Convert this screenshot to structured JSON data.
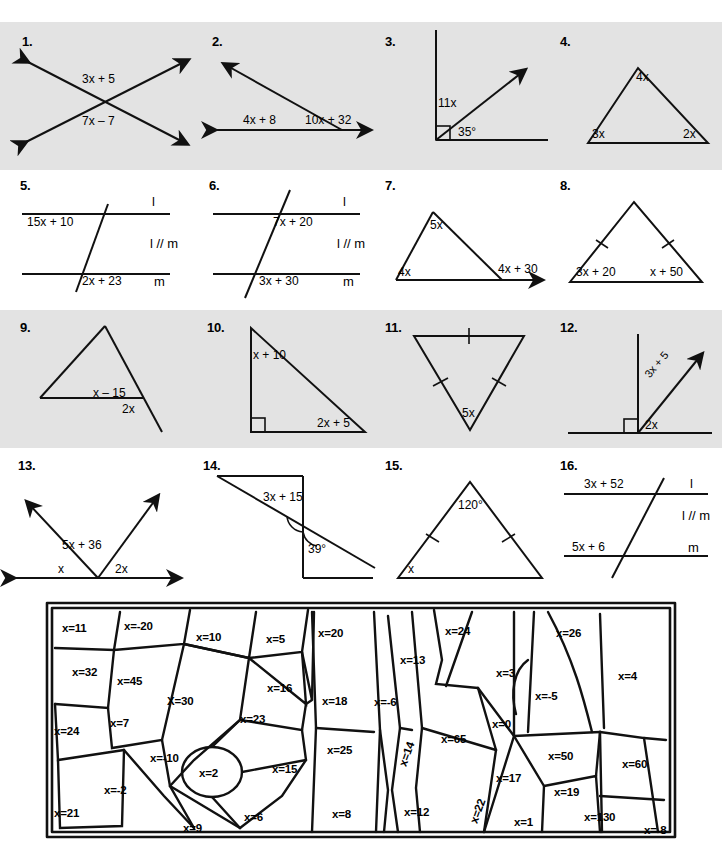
{
  "worksheet": {
    "rows": [
      {
        "shaded": true,
        "problems": [
          {
            "number": "1.",
            "type": "vertical-angles",
            "labels": [
              "3x + 5",
              "7x – 7"
            ]
          },
          {
            "number": "2.",
            "type": "linear-pair-ray",
            "labels": [
              "4x + 8",
              "10x + 32"
            ]
          },
          {
            "number": "3.",
            "type": "right-angle-ray",
            "labels": [
              "11x",
              "35°"
            ]
          },
          {
            "number": "4.",
            "type": "triangle-angles",
            "labels": [
              "4x",
              "3x",
              "2x"
            ]
          }
        ]
      },
      {
        "shaded": false,
        "problems": [
          {
            "number": "5.",
            "type": "parallel-lines-transversal",
            "labels": [
              "15x + 10",
              "2x + 23",
              "l",
              "m",
              "l // m"
            ]
          },
          {
            "number": "6.",
            "type": "parallel-lines-transversal",
            "labels": [
              "7x + 20",
              "3x + 30",
              "l",
              "m",
              "l // m"
            ]
          },
          {
            "number": "7.",
            "type": "triangle-exterior",
            "labels": [
              "5x",
              "4x",
              "4x + 30"
            ]
          },
          {
            "number": "8.",
            "type": "isosceles-triangle",
            "labels": [
              "3x + 20",
              "x + 50"
            ]
          }
        ]
      },
      {
        "shaded": true,
        "problems": [
          {
            "number": "9.",
            "type": "triangle-exterior",
            "labels": [
              "x – 15",
              "2x"
            ]
          },
          {
            "number": "10.",
            "type": "right-triangle",
            "labels": [
              "x + 10",
              "2x + 5"
            ]
          },
          {
            "number": "11.",
            "type": "isosceles-triangle-down",
            "labels": [
              "5x"
            ]
          },
          {
            "number": "12.",
            "type": "right-angle-ray",
            "labels": [
              "3x + 5",
              "2x"
            ]
          }
        ]
      },
      {
        "shaded": false,
        "problems": [
          {
            "number": "13.",
            "type": "angles-on-line",
            "labels": [
              "5x + 36",
              "x",
              "2x"
            ]
          },
          {
            "number": "14.",
            "type": "transversal-angles",
            "labels": [
              "3x + 15",
              "39°"
            ]
          },
          {
            "number": "15.",
            "type": "isosceles-triangle",
            "labels": [
              "120°",
              "x"
            ]
          },
          {
            "number": "16.",
            "type": "parallel-lines-transversal",
            "labels": [
              "3x + 52",
              "5x + 6",
              "l",
              "m",
              "l // m"
            ]
          }
        ]
      }
    ]
  },
  "problems": {
    "p1": {
      "num": "1.",
      "a": "3x + 5",
      "b": "7x – 7"
    },
    "p2": {
      "num": "2.",
      "a": "4x + 8",
      "b": "10x + 32"
    },
    "p3": {
      "num": "3.",
      "a": "11x",
      "b": "35°"
    },
    "p4": {
      "num": "4.",
      "a": "4x",
      "b": "3x",
      "c": "2x"
    },
    "p5": {
      "num": "5.",
      "a": "15x + 10",
      "b": "2x + 23",
      "l": "l",
      "m": "m",
      "par": "l // m"
    },
    "p6": {
      "num": "6.",
      "a": "7x + 20",
      "b": "3x + 30",
      "l": "l",
      "m": "m",
      "par": "l // m"
    },
    "p7": {
      "num": "7.",
      "a": "5x",
      "b": "4x",
      "c": "4x + 30"
    },
    "p8": {
      "num": "8.",
      "a": "3x + 20",
      "b": "x + 50"
    },
    "p9": {
      "num": "9.",
      "a": "x – 15",
      "b": "2x"
    },
    "p10": {
      "num": "10.",
      "a": "x + 10",
      "b": "2x + 5"
    },
    "p11": {
      "num": "11.",
      "a": "5x"
    },
    "p12": {
      "num": "12.",
      "a": "3x + 5",
      "b": "2x"
    },
    "p13": {
      "num": "13.",
      "a": "5x + 36",
      "b": "x",
      "c": "2x"
    },
    "p14": {
      "num": "14.",
      "a": "3x + 15",
      "b": "39°"
    },
    "p15": {
      "num": "15.",
      "a": "120°",
      "b": "x"
    },
    "p16": {
      "num": "16.",
      "a": "3x + 52",
      "b": "5x + 6",
      "l": "l",
      "m": "m",
      "par": "l // m"
    }
  },
  "answer_bank": {
    "cells": [
      {
        "label": "x=11",
        "x": 18,
        "y": 22
      },
      {
        "label": "x=-20",
        "x": 80,
        "y": 20
      },
      {
        "label": "x=10",
        "x": 152,
        "y": 31
      },
      {
        "label": "x=5",
        "x": 222,
        "y": 33
      },
      {
        "label": "x=20",
        "x": 274,
        "y": 27
      },
      {
        "label": "x=24",
        "x": 401,
        "y": 25
      },
      {
        "label": "x=26",
        "x": 512,
        "y": 27
      },
      {
        "label": "x=32",
        "x": 28,
        "y": 66
      },
      {
        "label": "x=45",
        "x": 73,
        "y": 75
      },
      {
        "label": "x=13",
        "x": 356,
        "y": 54
      },
      {
        "label": "x=3",
        "x": 452,
        "y": 67
      },
      {
        "label": "x=4",
        "x": 574,
        "y": 70
      },
      {
        "label": "X=30",
        "x": 123,
        "y": 95
      },
      {
        "label": "x=16",
        "x": 223,
        "y": 82
      },
      {
        "label": "x=18",
        "x": 278,
        "y": 95
      },
      {
        "label": "x=-6",
        "x": 330,
        "y": 96
      },
      {
        "label": "x=-5",
        "x": 491,
        "y": 90
      },
      {
        "label": "x=24",
        "x": 10,
        "y": 125
      },
      {
        "label": "x=7",
        "x": 66,
        "y": 117
      },
      {
        "label": "x=23",
        "x": 196,
        "y": 113
      },
      {
        "label": "x=0",
        "x": 448,
        "y": 118
      },
      {
        "label": "x=-10",
        "x": 106,
        "y": 152
      },
      {
        "label": "x=25",
        "x": 283,
        "y": 144
      },
      {
        "label": "x=65",
        "x": 397,
        "y": 133
      },
      {
        "label": "x=50",
        "x": 504,
        "y": 150
      },
      {
        "label": "x=60",
        "x": 578,
        "y": 158
      },
      {
        "label": "x=2",
        "x": 155,
        "y": 167
      },
      {
        "label": "x=15",
        "x": 228,
        "y": 163
      },
      {
        "label": "x=-2",
        "x": 60,
        "y": 184
      },
      {
        "label": "x=14",
        "x": 350,
        "y": 148,
        "rot": true
      },
      {
        "label": "x=17",
        "x": 452,
        "y": 172
      },
      {
        "label": "x=19",
        "x": 510,
        "y": 186
      },
      {
        "label": "x=21",
        "x": 10,
        "y": 207
      },
      {
        "label": "x=9",
        "x": 139,
        "y": 222
      },
      {
        "label": "x=6",
        "x": 200,
        "y": 211
      },
      {
        "label": "x=8",
        "x": 288,
        "y": 208
      },
      {
        "label": "x=12",
        "x": 360,
        "y": 206
      },
      {
        "label": "x=22",
        "x": 421,
        "y": 205,
        "rot": true
      },
      {
        "label": "x=1",
        "x": 470,
        "y": 216
      },
      {
        "label": "x=130",
        "x": 540,
        "y": 211
      },
      {
        "label": "x=-8",
        "x": 600,
        "y": 224
      }
    ]
  },
  "colors": {
    "ink": "#111111",
    "shaded_band": "#e3e3e3",
    "page": "#ffffff"
  }
}
